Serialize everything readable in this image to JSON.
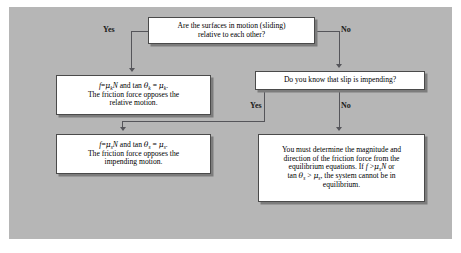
{
  "figure": {
    "panel_color": "#b6b6b6",
    "box_fill": "#ffffff",
    "line_color": "#55555a"
  },
  "boxes": {
    "top_question": {
      "line1": "Are the surfaces in motion (sliding)",
      "line2": "relative to each other?"
    },
    "kinetic_result": {
      "formula": {
        "f": "f",
        "eq1": "=",
        "mu": "μ",
        "mu_sub": "k",
        "N": "N",
        "conj": "and tan",
        "theta": "θ",
        "theta_sub": "k",
        "eq2": "=",
        "mu2": "μ",
        "mu2_sub": "k",
        "period": "."
      },
      "line2": "The friction force opposes the",
      "line3": "relative motion."
    },
    "slip_question": {
      "line1": "Do you know that slip is impending?"
    },
    "static_result": {
      "formula": {
        "f": "f",
        "eq1": "=",
        "mu": "μ",
        "mu_sub": "s",
        "N": "N",
        "conj": "and tan",
        "theta": "θ",
        "theta_sub": "s",
        "eq2": "=",
        "mu2": "μ",
        "mu2_sub": "s",
        "period": "."
      },
      "line2": "The friction force opposes the",
      "line3": "impending motion."
    },
    "equilibrium_result": {
      "line1": "You must determine the magnitude and",
      "line2": "direction of the friction force from the",
      "line3_a": "equilibrium equations. If",
      "line3_f": "f",
      "line3_gt": ">",
      "line3_mu": "μ",
      "line3_mu_sub": "s",
      "line3_N": "N",
      "line3_b": "or",
      "line4_tan": "tan",
      "line4_theta": "θ",
      "line4_theta_sub": "s",
      "line4_gt": ">",
      "line4_mu": "μ",
      "line4_mu_sub": "s",
      "line4_b": ", the system cannot be in",
      "line5": "equilibrium."
    }
  },
  "branch_labels": {
    "yes_top": "Yes",
    "no_top": "No",
    "yes_middle": "Yes",
    "no_middle": "No"
  }
}
